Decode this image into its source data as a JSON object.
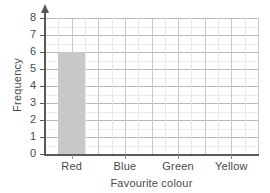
{
  "chart_data": {
    "type": "bar",
    "title": "",
    "xlabel": "Favourite colour",
    "ylabel": "Frequency",
    "categories": [
      "Red",
      "Blue",
      "Green",
      "Yellow"
    ],
    "values": [
      6,
      0,
      0,
      0
    ],
    "ylim": [
      0,
      8
    ],
    "ytick_labels": [
      "0",
      "1",
      "2",
      "3",
      "4",
      "5",
      "6",
      "7",
      "8"
    ],
    "ytick_values": [
      0,
      1,
      2,
      3,
      4,
      5,
      6,
      7,
      8
    ],
    "grid": true,
    "legend": "none",
    "bar_color": "#c8c8c8",
    "axis_color": "#595959",
    "grid_color": "#b9b9b9",
    "minor_grid_color": "#ececec",
    "background_color": "#ffffff"
  }
}
